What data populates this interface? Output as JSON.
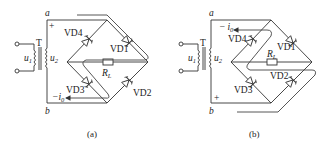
{
  "figure": {
    "panels": [
      {
        "id": "a",
        "caption": "(a)",
        "transformer": "T",
        "primary": "u",
        "primary_sub": "1",
        "secondary": "u",
        "secondary_sub": "2",
        "node_top": "a",
        "node_bottom": "b",
        "polarity_top": "+",
        "polarity_bottom": "",
        "diodes": [
          "VD4",
          "VD1",
          "VD3",
          "VD2"
        ],
        "load": "R",
        "load_sub": "L",
        "current_label": "i",
        "current_sub": "0",
        "current_sign": "−"
      },
      {
        "id": "b",
        "caption": "(b)",
        "transformer": "T",
        "primary": "u",
        "primary_sub": "1",
        "secondary": "u",
        "secondary_sub": "2",
        "node_top": "a",
        "node_bottom": "b",
        "polarity_top": "",
        "polarity_bottom": "+",
        "diodes": [
          "VD4",
          "VD1",
          "VD3",
          "VD2"
        ],
        "load": "R",
        "load_sub": "L",
        "current_label": "i",
        "current_sub": "0",
        "current_sign": "−"
      }
    ]
  }
}
